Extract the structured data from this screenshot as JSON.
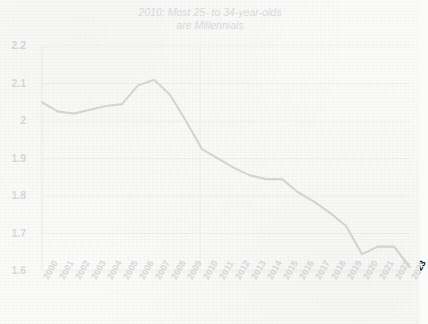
{
  "chart_data": {
    "type": "line",
    "title_line1": "2010: Most 25- to 34-year-olds",
    "title_line2": "are Millennials",
    "xlabel": "",
    "ylabel": "",
    "xlim": [
      2000,
      2023
    ],
    "ylim": [
      1.6,
      2.2
    ],
    "grid": true,
    "legend": false,
    "line_color": "#151515",
    "grid_color": "#b9b9b9",
    "categories": [
      "2000",
      "2001",
      "2002",
      "2003",
      "2004",
      "2005",
      "2006",
      "2007",
      "2008",
      "2009",
      "2010",
      "2011",
      "2012",
      "2013",
      "2014",
      "2015",
      "2016",
      "2017",
      "2018",
      "2019",
      "2020",
      "2021",
      "2022",
      "2023"
    ],
    "x": [
      2000,
      2001,
      2002,
      2003,
      2004,
      2005,
      2006,
      2007,
      2008,
      2009,
      2010,
      2011,
      2012,
      2013,
      2014,
      2015,
      2016,
      2017,
      2018,
      2019,
      2020,
      2021,
      2022,
      2023
    ],
    "values": [
      2.05,
      2.025,
      2.02,
      2.03,
      2.04,
      2.045,
      2.095,
      2.11,
      2.07,
      2.0,
      1.925,
      1.9,
      1.875,
      1.855,
      1.845,
      1.845,
      1.81,
      1.785,
      1.755,
      1.72,
      1.645,
      1.665,
      1.665,
      1.61
    ],
    "series": [
      {
        "name": "Median age ratio",
        "values": [
          2.05,
          2.025,
          2.02,
          2.03,
          2.04,
          2.045,
          2.095,
          2.11,
          2.07,
          2.0,
          1.925,
          1.9,
          1.875,
          1.855,
          1.845,
          1.845,
          1.81,
          1.785,
          1.755,
          1.72,
          1.645,
          1.665,
          1.665,
          1.61
        ]
      }
    ],
    "y_ticks": [
      "2.2",
      "2.1",
      "2",
      "1.9",
      "1.8",
      "1.7",
      "1.6"
    ],
    "y_tick_values": [
      2.2,
      2.1,
      2.0,
      1.9,
      1.8,
      1.7,
      1.6
    ]
  }
}
